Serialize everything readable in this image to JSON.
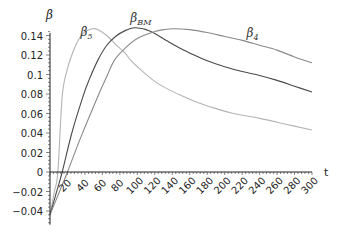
{
  "chart_data": {
    "type": "line",
    "title": "",
    "xlabel": "t",
    "ylabel": "β",
    "xlim": [
      0,
      300
    ],
    "ylim": [
      -0.054,
      0.155
    ],
    "grid": false,
    "legend": "inline labels on curves",
    "x_ticks": [
      20,
      40,
      60,
      80,
      100,
      120,
      140,
      160,
      180,
      200,
      220,
      240,
      260,
      280,
      300
    ],
    "y_ticks": [
      -0.04,
      -0.02,
      0,
      0.02,
      0.04,
      0.06,
      0.08,
      0.1,
      0.12,
      0.14
    ],
    "y_tick_labels": [
      "−0.04",
      "−0.02",
      "0",
      "0.02",
      "0.04",
      "0.06",
      "0.08",
      "0.1",
      "0.12",
      "0.14"
    ],
    "series": [
      {
        "name": "β5",
        "label_main": "β",
        "label_sub": "5",
        "color": "#b4b4b4",
        "label_pos": [
          35,
          0.139
        ],
        "x": [
          0,
          5,
          9,
          14,
          20,
          25,
          30,
          35,
          40,
          45,
          49,
          55,
          65,
          75,
          86,
          92,
          105,
          120,
          135,
          149,
          170,
          190,
          210,
          240,
          270,
          300
        ],
        "y": [
          -0.044,
          -0.02,
          0,
          0.078,
          0.106,
          0.12,
          0.131,
          0.139,
          0.144,
          0.146,
          0.147,
          0.146,
          0.14,
          0.131,
          0.122,
          0.115,
          0.104,
          0.093,
          0.085,
          0.079,
          0.071,
          0.065,
          0.06,
          0.055,
          0.049,
          0.043
        ]
      },
      {
        "name": "βBM",
        "label_main": "β",
        "label_sub": "BM",
        "color": "#4a4a4a",
        "label_pos": [
          92,
          0.154
        ],
        "x": [
          0,
          7,
          14,
          25,
          38,
          45,
          55,
          65,
          75,
          86,
          97,
          110,
          120,
          135,
          149,
          165,
          180,
          200,
          220,
          240,
          260,
          280,
          300
        ],
        "y": [
          -0.044,
          -0.022,
          0,
          0.04,
          0.078,
          0.095,
          0.115,
          0.13,
          0.139,
          0.145,
          0.148,
          0.146,
          0.142,
          0.134,
          0.127,
          0.12,
          0.114,
          0.108,
          0.103,
          0.099,
          0.094,
          0.088,
          0.082
        ]
      },
      {
        "name": "β4",
        "label_main": "β",
        "label_sub": "4",
        "color": "#8a8a8a",
        "label_pos": [
          225,
          0.138
        ],
        "x": [
          0,
          10,
          20,
          35,
          55,
          65,
          74,
          86,
          100,
          120,
          130,
          141,
          160,
          180,
          200,
          220,
          240,
          260,
          280,
          300
        ],
        "y": [
          -0.044,
          -0.022,
          0,
          0.035,
          0.078,
          0.098,
          0.115,
          0.127,
          0.137,
          0.144,
          0.146,
          0.147,
          0.146,
          0.143,
          0.139,
          0.135,
          0.13,
          0.125,
          0.118,
          0.112
        ]
      }
    ]
  }
}
